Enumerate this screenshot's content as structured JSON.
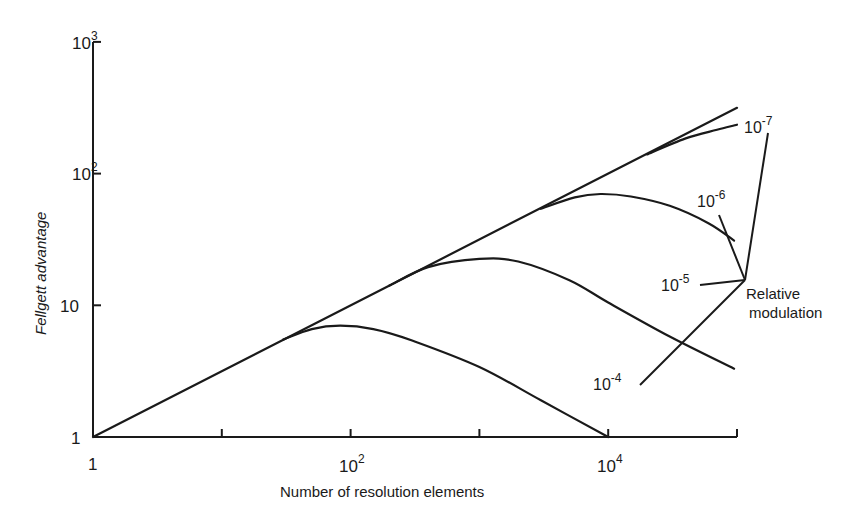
{
  "chart_data": {
    "type": "line",
    "title": "",
    "xlabel": "Number of resolution elements",
    "ylabel": "Fellgett advantage",
    "xscale": "log",
    "yscale": "log",
    "xlim": [
      1,
      100000
    ],
    "ylim": [
      1,
      1000
    ],
    "grid": false,
    "x_ticks": [
      1,
      10,
      100,
      1000,
      10000,
      100000
    ],
    "x_tick_labels": [
      {
        "value": 1,
        "base": "1",
        "exp": ""
      },
      {
        "value": 100,
        "base": "10",
        "exp": "2"
      },
      {
        "value": 10000,
        "base": "10",
        "exp": "4"
      }
    ],
    "y_ticks": [
      1,
      10,
      100,
      1000
    ],
    "y_tick_labels": [
      {
        "value": 1,
        "base": "1",
        "exp": ""
      },
      {
        "value": 10,
        "base": "10",
        "exp": ""
      },
      {
        "value": 100,
        "base": "10",
        "exp": "2"
      },
      {
        "value": 1000,
        "base": "10",
        "exp": "3"
      }
    ],
    "series": [
      {
        "name": "ideal (sqrt N)",
        "x": [
          1,
          100000
        ],
        "y": [
          1,
          316
        ]
      },
      {
        "name": "10^-4",
        "x": [
          1,
          30,
          50,
          83,
          150,
          300,
          1000,
          3000,
          10000
        ],
        "y": [
          1,
          5.5,
          6.6,
          7.0,
          6.6,
          5.4,
          3.4,
          1.9,
          1.0
        ]
      },
      {
        "name": "10^-5",
        "x": [
          1,
          200,
          400,
          1000,
          2000,
          5000,
          10000,
          30000,
          95000
        ],
        "y": [
          1,
          14.1,
          19.5,
          22.5,
          21.5,
          15.5,
          10.5,
          5.8,
          3.3
        ]
      },
      {
        "name": "10^-6",
        "x": [
          1,
          3000,
          5500,
          8700,
          15000,
          30000,
          60000,
          95000
        ],
        "y": [
          1,
          54,
          66,
          70,
          67,
          57,
          42,
          31
        ]
      },
      {
        "name": "10^-7",
        "x": [
          1,
          20000,
          40000,
          70000,
          100000
        ],
        "y": [
          1,
          140,
          185,
          215,
          235
        ]
      }
    ],
    "annotations": [
      {
        "text_base": "10",
        "text_exp": "-7",
        "target": "10^-7"
      },
      {
        "text_base": "10",
        "text_exp": "-6",
        "target": "10^-6"
      },
      {
        "text_base": "10",
        "text_exp": "-5",
        "target": "10^-5"
      },
      {
        "text_base": "10",
        "text_exp": "-4",
        "target": "10^-4"
      },
      {
        "text_line1": "Relative",
        "text_line2": "modulation"
      }
    ]
  }
}
